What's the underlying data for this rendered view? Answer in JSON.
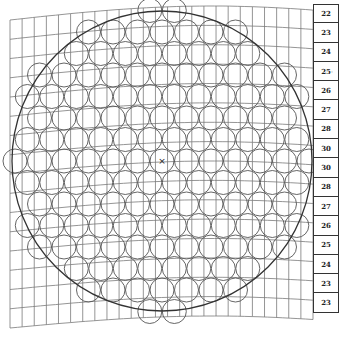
{
  "diagram": {
    "center_mark": "×",
    "colors": {
      "line": "#555555",
      "grid": "#7a7a7a",
      "text": "#222222",
      "background": "#ffffff"
    },
    "grid": {
      "columns": 25,
      "rows": 16
    },
    "boundary_circle": {
      "cx": 162,
      "cy": 161,
      "r": 150
    },
    "small_circle_radius": 12
  },
  "row_values": [
    "22",
    "23",
    "24",
    "25",
    "26",
    "27",
    "28",
    "30",
    "30",
    "28",
    "27",
    "26",
    "25",
    "24",
    "23",
    "23"
  ],
  "stray_mark": "'"
}
